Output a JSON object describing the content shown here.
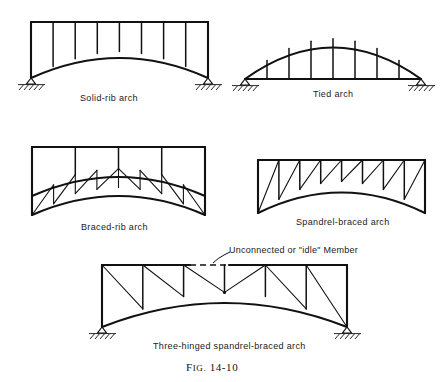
{
  "figure": {
    "number_prefix": "F",
    "number_smallcaps": "IG.",
    "number": "14-10",
    "caption_full": "Fig. 14-10"
  },
  "panels": [
    {
      "id": "solid-rib-arch",
      "label": "Solid-rib arch",
      "supports": "hinged",
      "posts": 8,
      "description": "Solid curved rib with straight top chord and vertical posts"
    },
    {
      "id": "tied-arch",
      "label": "Tied arch",
      "supports": "hinged",
      "hangers": 7,
      "description": "Curved top chord with horizontal tie and vertical hangers"
    },
    {
      "id": "braced-rib-arch",
      "label": "Braced-rib arch",
      "supports": "none",
      "posts": 3,
      "description": "Two curved chords with triangulated web between them"
    },
    {
      "id": "spandrel-braced-arch",
      "label": "Spandrel-braced arch",
      "supports": "none",
      "posts": 7,
      "description": "Straight top chord over curved lower chord with diagonals"
    },
    {
      "id": "three-hinged-spandrel-braced-arch",
      "label": "Three-hinged spandrel-braced arch",
      "supports": "hinged",
      "posts": 5,
      "annotation": "Unconnected or \"idle\" Member",
      "description": "Spandrel-braced arch with crown hinge and idle top-chord member"
    }
  ],
  "annotations": [
    {
      "id": "idle-member-note",
      "text": "Unconnected or \"idle\" Member",
      "target": "three-hinged-spandrel-braced-arch"
    }
  ],
  "colors": {
    "ink": "#111111",
    "paper": "#ffffff"
  }
}
